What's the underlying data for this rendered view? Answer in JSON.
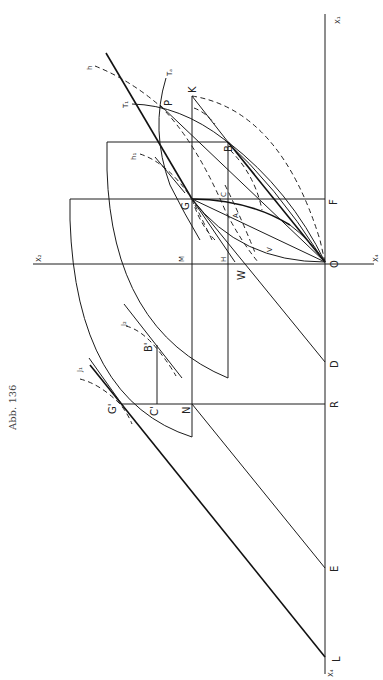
{
  "page": {
    "header_left": "",
    "header_center": "",
    "caption": "Abb. 136"
  },
  "labels": {
    "X1": "X₁",
    "X2": "X₂",
    "X4_top": "X₄",
    "X4_bottom": "X₄",
    "K": "K",
    "P": "P",
    "T1": "T₁",
    "Ta": "Tₐ",
    "h": "h",
    "h1": "h₁",
    "B": "B",
    "G": "G",
    "C": "C",
    "F": "F",
    "A": "A",
    "V": "V",
    "M": "M",
    "H": "H",
    "W": "W",
    "O": "O",
    "J1": "J₁",
    "J2": "J₂",
    "B_prime": "B'",
    "G_prime": "G'",
    "C_prime": "C'",
    "N": "N",
    "D": "D",
    "R": "R",
    "E": "E",
    "L": "L"
  }
}
